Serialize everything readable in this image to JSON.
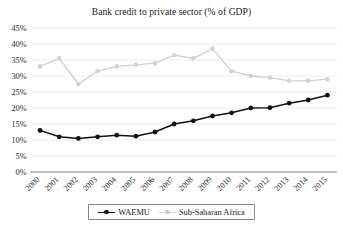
{
  "chart_data": {
    "type": "line",
    "title": "Bank credit to private sector (% of GDP)",
    "xlabel": "",
    "ylabel": "",
    "ylim": [
      0,
      45
    ],
    "ytick_step": 5,
    "grid": true,
    "legend_position": "bottom",
    "categories": [
      "2000",
      "2001",
      "2002",
      "2003",
      "2004",
      "2005",
      "2006",
      "2007",
      "2008",
      "2009",
      "2010",
      "2011",
      "2012",
      "2013",
      "2014",
      "2015"
    ],
    "ytick_labels": [
      "0%",
      "5%",
      "10%",
      "15%",
      "20%",
      "25%",
      "30%",
      "35%",
      "40%",
      "45%"
    ],
    "series": [
      {
        "name": "WAEMU",
        "color": "#111111",
        "marker": "filled-circle",
        "values": [
          13.0,
          11.0,
          10.5,
          11.0,
          11.5,
          11.2,
          12.5,
          15.0,
          16.0,
          17.5,
          18.5,
          20.0,
          20.1,
          21.5,
          22.5,
          24.0
        ]
      },
      {
        "name": "Sub-Saharan Africa",
        "color": "#d2d2d2",
        "marker": "filled-circle",
        "values": [
          33.0,
          35.5,
          27.5,
          31.5,
          33.0,
          33.5,
          34.0,
          36.5,
          35.5,
          38.5,
          31.5,
          30.0,
          29.5,
          28.5,
          28.5,
          29.0
        ]
      }
    ]
  },
  "legend": {
    "items": [
      {
        "label": "WAEMU"
      },
      {
        "label": "Sub-Saharan Africa"
      }
    ]
  }
}
